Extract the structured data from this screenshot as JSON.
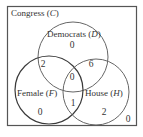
{
  "diagram": {
    "type": "venn",
    "universe": {
      "label": "Congress",
      "symbol": "C",
      "outside_count": "0"
    },
    "sets": [
      {
        "key": "D",
        "label": "Democrats",
        "symbol": "D"
      },
      {
        "key": "F",
        "label": "Female",
        "symbol": "F"
      },
      {
        "key": "H",
        "label": "House",
        "symbol": "H"
      }
    ],
    "regions": {
      "D_only": "0",
      "F_only": "0",
      "H_only": "2",
      "D_and_F_only": "2",
      "D_and_H_only": "6",
      "F_and_H_only": "1",
      "D_and_F_and_H": "0"
    },
    "colors": {
      "stroke": "#555555",
      "female_stroke": "#3a3a3a",
      "text": "#333333",
      "background": "#ffffff"
    }
  }
}
